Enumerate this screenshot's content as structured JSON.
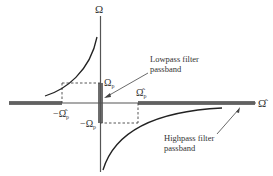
{
  "diagram": {
    "axes": {
      "vertical_label": "Ω",
      "horizontal_label": "Ω̂"
    },
    "markers": {
      "omega_p": "Ω",
      "omega_p_sub": "p",
      "neg_omega_p": "−Ω",
      "neg_omega_p_sub": "p",
      "omega_hat_p": "Ω̂",
      "omega_hat_p_sub": "p",
      "neg_omega_hat_p": "−Ω̂",
      "neg_omega_hat_p_sub": "p"
    },
    "annotations": {
      "lowpass_line1": "Lowpass filter",
      "lowpass_line2": "passband",
      "highpass_line1": "Highpass filter",
      "highpass_line2": "passband"
    },
    "colors": {
      "axis": "#555555",
      "curve": "#222222",
      "passband": "#6e6e6e",
      "dashed": "#444444"
    }
  }
}
